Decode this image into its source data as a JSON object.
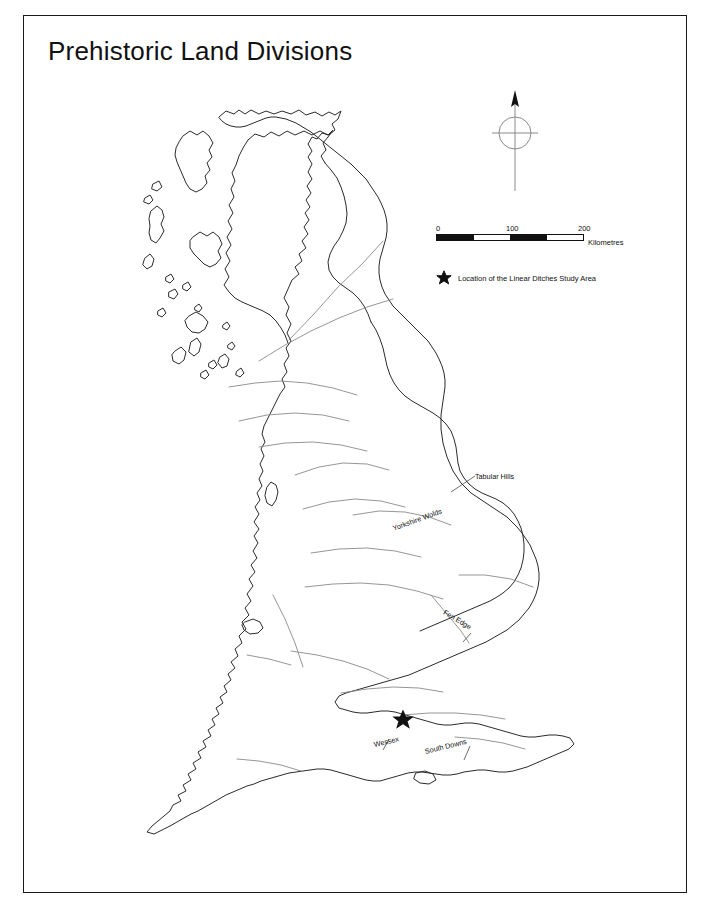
{
  "figure": {
    "title": "Prehistoric Land Divisions",
    "background_color": "#ffffff",
    "frame_color": "#1a1a1a",
    "coastline_color": "#2b2b2b",
    "division_line_color": "#8a8a8a"
  },
  "compass": {
    "name": "north-arrow",
    "north_label": ""
  },
  "scale_bar": {
    "tick_labels": [
      "0",
      "100",
      "200"
    ],
    "unit_label": "Kilometres",
    "segments": [
      "fill",
      "blank",
      "fill",
      "blank"
    ],
    "max_value": 200
  },
  "legend": {
    "symbol": "star-icon",
    "label": "Location of the Linear Ditches Study Area"
  },
  "map_labels": [
    {
      "id": "tabular-hills",
      "text": "Tabular Hills"
    },
    {
      "id": "yorkshire-wolds",
      "text": "Yorkshire Wolds"
    },
    {
      "id": "fen-edge",
      "text": "Fen Edge"
    },
    {
      "id": "wessex",
      "text": "Wessex"
    },
    {
      "id": "south-downs",
      "text": "South Downs"
    }
  ],
  "study_area_marker": {
    "symbol": "star-icon",
    "region": "Wessex"
  }
}
